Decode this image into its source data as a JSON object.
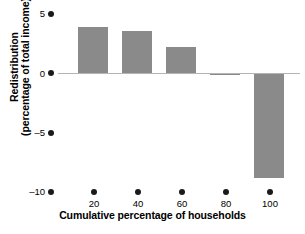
{
  "chart_data": {
    "type": "bar",
    "title": "",
    "subtitle": "",
    "xlabel": "Cumulative percentage of households",
    "ylabel_line1": "Redistribution",
    "ylabel_line2": "(percentage of total income)",
    "categories": [
      "20",
      "40",
      "60",
      "80",
      "100"
    ],
    "x": [
      20,
      40,
      60,
      80,
      100
    ],
    "values": [
      3.9,
      3.6,
      2.2,
      -0.1,
      -8.8
    ],
    "series": [
      {
        "name": "Redistribution",
        "values": [
          3.9,
          3.6,
          2.2,
          -0.1,
          -8.8
        ]
      }
    ],
    "xtick_labels": [
      "20",
      "40",
      "60",
      "80",
      "100"
    ],
    "ytick_labels": [
      "5",
      "0",
      "–5",
      "–10"
    ],
    "ytick_values": [
      5,
      0,
      -5,
      -10
    ],
    "ylim": [
      -10,
      5
    ],
    "xlim": [
      0,
      110
    ],
    "grid": false,
    "legend": "none",
    "bar_color": "#8a8a8a",
    "zero_line_color": "#b4b4b4",
    "tick_marker": "filled-dot",
    "tick_marker_color": "#1a1a1a"
  },
  "axes": {
    "y": {
      "title_line1": "Redistribution",
      "title_line2": "(percentage of total income)",
      "ticks": [
        {
          "label": "5",
          "value": 5
        },
        {
          "label": "0",
          "value": 0
        },
        {
          "label": "–5",
          "value": -5
        },
        {
          "label": "–10",
          "value": -10
        }
      ]
    },
    "x": {
      "title": "Cumulative percentage of households",
      "ticks": [
        {
          "label": "20",
          "value": 20
        },
        {
          "label": "40",
          "value": 40
        },
        {
          "label": "60",
          "value": 60
        },
        {
          "label": "80",
          "value": 80
        },
        {
          "label": "100",
          "value": 100
        }
      ]
    }
  },
  "caption": ""
}
